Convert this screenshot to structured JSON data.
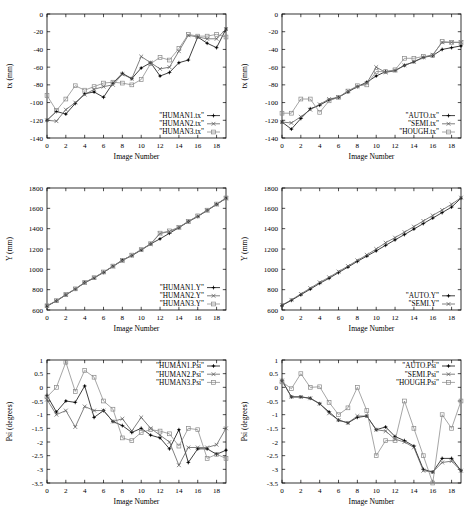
{
  "figure": {
    "background_color": "#ffffff",
    "ink_color": "#000000",
    "width": 470,
    "height": 519,
    "panel_count": 6
  },
  "common": {
    "xlabel": "Image Number",
    "xticks": [
      0,
      2,
      4,
      6,
      8,
      10,
      12,
      14,
      16,
      18
    ],
    "xlim": [
      0,
      19
    ]
  },
  "chart_data": [
    {
      "id": "panel-top-left",
      "type": "line",
      "title": "",
      "xlabel": "Image Number",
      "ylabel": "tx (mm)",
      "xlim": [
        0,
        19
      ],
      "ylim": [
        -140,
        0
      ],
      "xticks": [
        0,
        2,
        4,
        6,
        8,
        10,
        12,
        14,
        16,
        18
      ],
      "yticks": [
        0,
        -20,
        -40,
        -60,
        -80,
        -100,
        -120,
        -140
      ],
      "grid": false,
      "legend_position": "bottom-right",
      "x": [
        0,
        1,
        2,
        3,
        4,
        5,
        6,
        7,
        8,
        9,
        10,
        11,
        12,
        13,
        14,
        15,
        16,
        17,
        18,
        19
      ],
      "series": [
        {
          "name": "\"HUMAN1.tx\"",
          "marker": "plus-dot",
          "color": "#000000",
          "values": [
            -120,
            -110,
            -113,
            -101,
            -90,
            -88,
            -94,
            -78,
            -67,
            -73,
            -61,
            -55,
            -70,
            -66,
            -55,
            -52,
            -26,
            -33,
            -38,
            -17
          ]
        },
        {
          "name": "\"HUMAN2.tx\"",
          "marker": "cross",
          "color": "#555555",
          "values": [
            -120,
            -121,
            -108,
            -100,
            -91,
            -85,
            -82,
            -80,
            -68,
            -73,
            -48,
            -55,
            -62,
            -60,
            -42,
            -24,
            -26,
            -28,
            -28,
            -17
          ]
        },
        {
          "name": "\"HUMAN3.tx\"",
          "marker": "square",
          "color": "#888888",
          "values": [
            -92,
            -109,
            -96,
            -81,
            -86,
            -82,
            -78,
            -77,
            -78,
            -80,
            -74,
            -56,
            -49,
            -52,
            -39,
            -23,
            -25,
            -25,
            -23,
            -26
          ]
        }
      ]
    },
    {
      "id": "panel-top-right",
      "type": "line",
      "title": "",
      "xlabel": "Image Number",
      "ylabel": "tx (mm)",
      "xlim": [
        0,
        19
      ],
      "ylim": [
        -140,
        0
      ],
      "xticks": [
        0,
        2,
        4,
        6,
        8,
        10,
        12,
        14,
        16,
        18
      ],
      "yticks": [
        0,
        -20,
        -40,
        -60,
        -80,
        -100,
        -120,
        -140
      ],
      "grid": false,
      "legend_position": "bottom-right",
      "x": [
        0,
        1,
        2,
        3,
        4,
        5,
        6,
        7,
        8,
        9,
        10,
        11,
        12,
        13,
        14,
        15,
        16,
        17,
        18,
        19
      ],
      "series": [
        {
          "name": "\"AUTO.tx\"",
          "marker": "plus-dot",
          "color": "#000000",
          "values": [
            -122,
            -130,
            -118,
            -107,
            -103,
            -97,
            -94,
            -88,
            -82,
            -77,
            -70,
            -65,
            -64,
            -58,
            -54,
            -49,
            -47,
            -40,
            -38,
            -36
          ]
        },
        {
          "name": "\"SEMI.tx\"",
          "marker": "cross",
          "color": "#555555",
          "values": [
            -122,
            -123,
            -116,
            -108,
            -102,
            -96,
            -94,
            -87,
            -82,
            -78,
            -60,
            -66,
            -64,
            -58,
            -54,
            -49,
            -46,
            -32,
            -32,
            -32
          ]
        },
        {
          "name": "\"HOUGH.tx\"",
          "marker": "square",
          "color": "#888888",
          "values": [
            -112,
            -112,
            -96,
            -96,
            -111,
            -98,
            -94,
            -87,
            -81,
            -80,
            -65,
            -65,
            -63,
            -50,
            -50,
            -48,
            -47,
            -31,
            -32,
            -32
          ]
        }
      ]
    },
    {
      "id": "panel-middle-left",
      "type": "line",
      "title": "",
      "xlabel": "Image Number",
      "ylabel": "Y (mm)",
      "xlim": [
        0,
        19
      ],
      "ylim": [
        600,
        1800
      ],
      "xticks": [
        0,
        2,
        4,
        6,
        8,
        10,
        12,
        14,
        16,
        18
      ],
      "yticks": [
        600,
        800,
        1000,
        1200,
        1400,
        1600,
        1800
      ],
      "grid": false,
      "legend_position": "bottom-right",
      "x": [
        0,
        1,
        2,
        3,
        4,
        5,
        6,
        7,
        8,
        9,
        10,
        11,
        12,
        13,
        14,
        15,
        16,
        17,
        18,
        19
      ],
      "series": [
        {
          "name": "\"HUMAN1.Y\"",
          "marker": "plus-dot",
          "color": "#000000",
          "values": [
            638,
            690,
            750,
            805,
            870,
            915,
            970,
            1030,
            1090,
            1135,
            1190,
            1250,
            1300,
            1355,
            1410,
            1470,
            1520,
            1580,
            1640,
            1700
          ]
        },
        {
          "name": "\"HUMAN2.Y\"",
          "marker": "cross",
          "color": "#555555",
          "values": [
            640,
            688,
            748,
            806,
            866,
            916,
            972,
            1028,
            1086,
            1138,
            1192,
            1248,
            1352,
            1372,
            1412,
            1468,
            1522,
            1578,
            1638,
            1698
          ]
        },
        {
          "name": "\"HUMAN3.Y\"",
          "marker": "square",
          "color": "#888888",
          "values": [
            642,
            692,
            752,
            808,
            872,
            918,
            974,
            1032,
            1088,
            1140,
            1194,
            1252,
            1356,
            1378,
            1414,
            1472,
            1526,
            1582,
            1642,
            1702
          ]
        }
      ]
    },
    {
      "id": "panel-middle-right",
      "type": "line",
      "title": "",
      "xlabel": "Image Number",
      "ylabel": "Y (mm)",
      "xlim": [
        0,
        19
      ],
      "ylim": [
        600,
        1800
      ],
      "xticks": [
        0,
        2,
        4,
        6,
        8,
        10,
        12,
        14,
        16,
        18
      ],
      "yticks": [
        600,
        800,
        1000,
        1200,
        1400,
        1600,
        1800
      ],
      "grid": false,
      "legend_position": "bottom-right",
      "x": [
        0,
        1,
        2,
        3,
        4,
        5,
        6,
        7,
        8,
        9,
        10,
        11,
        12,
        13,
        14,
        15,
        16,
        17,
        18,
        19
      ],
      "series": [
        {
          "name": "\"AUTO.Y\"",
          "marker": "plus-dot",
          "color": "#000000",
          "values": [
            645,
            695,
            750,
            805,
            862,
            912,
            968,
            1022,
            1078,
            1130,
            1182,
            1236,
            1290,
            1342,
            1396,
            1450,
            1504,
            1558,
            1612,
            1700
          ]
        },
        {
          "name": "\"SEMI.Y\"",
          "marker": "cross",
          "color": "#555555",
          "values": [
            648,
            700,
            758,
            815,
            872,
            922,
            978,
            1032,
            1088,
            1142,
            1200,
            1262,
            1312,
            1366,
            1420,
            1476,
            1530,
            1584,
            1640,
            1705
          ]
        }
      ]
    },
    {
      "id": "panel-bottom-left",
      "type": "line",
      "title": "",
      "xlabel": "Image Number",
      "ylabel": "Psi (degrees)",
      "xlim": [
        0,
        19
      ],
      "ylim": [
        -3.5,
        1
      ],
      "xticks": [
        0,
        2,
        4,
        6,
        8,
        10,
        12,
        14,
        16,
        18
      ],
      "yticks": [
        1,
        0.5,
        0,
        -0.5,
        -1,
        -1.5,
        -2,
        -2.5,
        -3,
        -3.5
      ],
      "grid": false,
      "legend_position": "top-right",
      "x": [
        0,
        1,
        2,
        3,
        4,
        5,
        6,
        7,
        8,
        9,
        10,
        11,
        12,
        13,
        14,
        15,
        16,
        17,
        18,
        19
      ],
      "series": [
        {
          "name": "\"HUMAN1.Psi\"",
          "marker": "plus-dot",
          "color": "#000000",
          "values": [
            -0.3,
            -0.9,
            -0.5,
            -0.55,
            0.05,
            -1.1,
            -0.85,
            -1.25,
            -1.4,
            -1.65,
            -1.5,
            -1.75,
            -1.85,
            -2.25,
            -1.55,
            -2.75,
            -2.25,
            -2.25,
            -2.45,
            -2.3
          ]
        },
        {
          "name": "\"HUMAN2.Psi\"",
          "marker": "cross",
          "color": "#555555",
          "values": [
            -0.45,
            -1.0,
            -0.85,
            -1.45,
            -0.7,
            -0.85,
            -0.85,
            -1.25,
            -1.15,
            -1.6,
            -1.1,
            -1.5,
            -1.75,
            -2.0,
            -2.85,
            -2.2,
            -2.2,
            -2.2,
            -2.1,
            -1.5
          ]
        },
        {
          "name": "\"HUMAN3.Psi\"",
          "marker": "square",
          "color": "#888888",
          "values": [
            -0.35,
            0.0,
            0.92,
            -0.15,
            0.62,
            0.37,
            -0.5,
            -0.8,
            -1.85,
            -1.95,
            -1.65,
            -1.55,
            -1.6,
            -1.7,
            -2.15,
            -1.5,
            -1.55,
            -2.6,
            -2.45,
            -2.6
          ]
        }
      ]
    },
    {
      "id": "panel-bottom-right",
      "type": "line",
      "title": "",
      "xlabel": "Image Number",
      "ylabel": "Psi (degrees)",
      "xlim": [
        0,
        19
      ],
      "ylim": [
        -3.5,
        1
      ],
      "xticks": [
        0,
        2,
        4,
        6,
        8,
        10,
        12,
        14,
        16,
        18
      ],
      "yticks": [
        1,
        0.5,
        0,
        -0.5,
        -1,
        -1.5,
        -2,
        -2.5,
        -3,
        -3.5
      ],
      "grid": false,
      "legend_position": "top-right",
      "x": [
        0,
        1,
        2,
        3,
        4,
        5,
        6,
        7,
        8,
        9,
        10,
        11,
        12,
        13,
        14,
        15,
        16,
        17,
        18,
        19
      ],
      "series": [
        {
          "name": "\"AUTO.Psi\"",
          "marker": "plus-dot",
          "color": "#000000",
          "values": [
            0.25,
            -0.35,
            -0.35,
            -0.4,
            -0.6,
            -0.9,
            -1.2,
            -1.3,
            -1.1,
            -1.05,
            -1.55,
            -1.45,
            -1.8,
            -1.95,
            -2.15,
            -3.0,
            -3.1,
            -2.6,
            -2.6,
            -3.05
          ]
        },
        {
          "name": "\"SEMI.Psi\"",
          "marker": "cross",
          "color": "#555555",
          "values": [
            0.25,
            -0.35,
            -0.35,
            -0.4,
            -0.6,
            -0.95,
            -1.2,
            -1.3,
            -1.05,
            -1.05,
            -1.55,
            -1.6,
            -1.9,
            -2.0,
            -2.2,
            -3.05,
            -3.1,
            -2.75,
            -2.7,
            -3.05
          ]
        },
        {
          "name": "\"HOUGH.Psi\"",
          "marker": "square",
          "color": "#888888",
          "values": [
            0.2,
            -0.05,
            0.5,
            0.0,
            0.02,
            -0.55,
            -1.0,
            -0.75,
            0.0,
            -0.85,
            -2.5,
            -1.95,
            -1.95,
            -0.5,
            -1.5,
            -2.5,
            -3.5,
            -1.0,
            -1.5,
            -0.5
          ]
        }
      ]
    }
  ]
}
